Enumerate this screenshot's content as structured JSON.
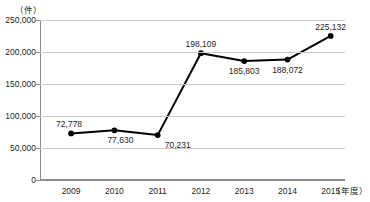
{
  "clipped_title": "‥‥‥‥  ‥‥‥‥‥‥‥  ‥‥‥",
  "chart_data": {
    "type": "line",
    "title": "",
    "xlabel": "（年度）",
    "ylabel": "（件）",
    "categories": [
      "2009",
      "2010",
      "2011",
      "2012",
      "2013",
      "2014",
      "2015"
    ],
    "values": [
      72778,
      77630,
      70231,
      198109,
      185803,
      188072,
      225132
    ],
    "value_labels": [
      "72,778",
      "77,630",
      "70,231",
      "198,109",
      "185,803",
      "188,072",
      "225,132"
    ],
    "label_positions": [
      "above",
      "below",
      "below",
      "above",
      "below",
      "below",
      "above"
    ],
    "ylim": [
      0,
      250000
    ],
    "ytick_values": [
      0,
      50000,
      100000,
      150000,
      200000,
      250000
    ],
    "ytick_labels": [
      "0",
      "50,000",
      "100,000",
      "150,000",
      "200,000",
      "250,000"
    ],
    "grid": true,
    "legend": "none",
    "marker": "filled-circle",
    "line_color": "#000000",
    "grid_color": "#c9c9c9",
    "axis_color": "#8d8d8d"
  }
}
